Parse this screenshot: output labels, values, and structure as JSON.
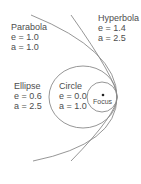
{
  "diagram": {
    "focus": {
      "label": "Focus"
    },
    "curves": [
      {
        "id": "parabola",
        "name": "Parabola",
        "e_label": "e = 1.0",
        "a_label": "a = 1.0"
      },
      {
        "id": "hyperbola",
        "name": "Hyperbola",
        "e_label": "e = 1.4",
        "a_label": "a = 2.5"
      },
      {
        "id": "ellipse",
        "name": "Ellipse",
        "e_label": "e = 0.6",
        "a_label": "a = 2.5"
      },
      {
        "id": "circle",
        "name": "Circle",
        "e_label": "e = 0.0",
        "a_label": "a = 1.0"
      }
    ],
    "colors": {
      "stroke": "#8a8a8a",
      "text": "#4d4d4d",
      "background": "#ffffff",
      "focus_dot": "#222222"
    }
  }
}
